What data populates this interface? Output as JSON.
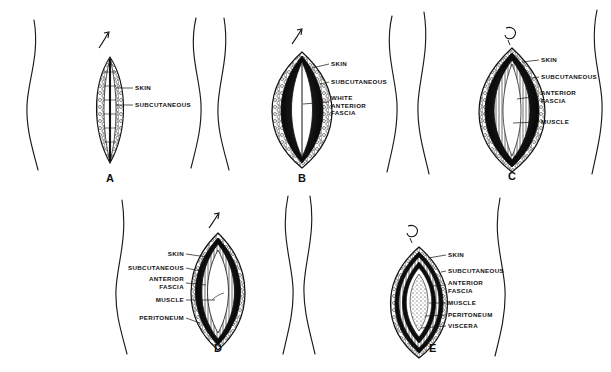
{
  "figure": {
    "background_color": "#ffffff",
    "ink_color": "#111111",
    "style": "black-and-white pen-and-ink medical illustration"
  },
  "panels": [
    {
      "letter": "A",
      "instrument_icon": "scalpel-arrow-icon",
      "label_side": "right",
      "description": "Narrow incision through skin showing subcutaneous fat globules",
      "labels": [
        {
          "text": "SKIN"
        },
        {
          "text": "SUBCUTANEOUS"
        }
      ]
    },
    {
      "letter": "B",
      "instrument_icon": "scalpel-arrow-icon",
      "label_side": "right",
      "description": "Incision opened wider exposing the white anterior fascia",
      "labels": [
        {
          "text": "SKIN"
        },
        {
          "text": "SUBCUTANEOUS"
        },
        {
          "text": "WHITE\nANTERIOR\nFASCIA",
          "lines": [
            "WHITE",
            "ANTERIOR",
            "FASCIA"
          ]
        }
      ]
    },
    {
      "letter": "C",
      "instrument_icon": "scalpel-hook-icon",
      "label_side": "right",
      "description": "Fascia divided, exposing the longitudinal muscle fibers",
      "labels": [
        {
          "text": "SKIN"
        },
        {
          "text": "SUBCUTANEOUS"
        },
        {
          "text": "ANTERIOR\nFASCIA",
          "lines": [
            "ANTERIOR",
            "FASCIA"
          ]
        },
        {
          "text": "MUSCLE"
        }
      ]
    },
    {
      "letter": "D",
      "instrument_icon": "scalpel-arrow-icon",
      "label_side": "left",
      "description": "Muscle retracted, peritoneum visible at the depth of the wound",
      "labels": [
        {
          "text": "SKIN"
        },
        {
          "text": "SUBCUTANEOUS"
        },
        {
          "text": "ANTERIOR\nFASCIA",
          "lines": [
            "ANTERIOR",
            "FASCIA"
          ]
        },
        {
          "text": "MUSCLE"
        },
        {
          "text": "PERITONEUM"
        }
      ]
    },
    {
      "letter": "E",
      "instrument_icon": "scalpel-hook-icon",
      "label_side": "right",
      "description": "Peritoneum opened, viscera exposed within the wound",
      "labels": [
        {
          "text": "SKIN"
        },
        {
          "text": "SUBCUTANEOUS"
        },
        {
          "text": "ANTERIOR\nFASCIA",
          "lines": [
            "ANTERIOR",
            "FASCIA"
          ]
        },
        {
          "text": "MUSCLE"
        },
        {
          "text": "PERITONEUM"
        },
        {
          "text": "VISCERA"
        }
      ]
    }
  ]
}
